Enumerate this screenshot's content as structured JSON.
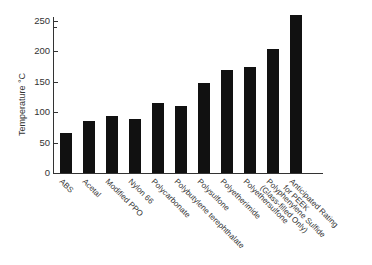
{
  "chart_data": {
    "type": "bar",
    "title": "",
    "xlabel": "",
    "ylabel": "Temperature °C",
    "ylim": [
      0,
      260
    ],
    "yticks": [
      0,
      50,
      100,
      150,
      200,
      250
    ],
    "grid": false,
    "legend": null,
    "categories": [
      "ABS",
      "Acetal",
      "Modified PPO",
      "Nylon 66",
      "Polycarbonate",
      "Polybutylene terephthalate",
      "Polysulfone",
      "Polyetherimide",
      "Polyethersulfone",
      "Polyphenylene Sulfide\n(Glass-filled Only)",
      "Anticipated Rating\nfor PEEK"
    ],
    "values": [
      65,
      85,
      93,
      89,
      115,
      110,
      148,
      170,
      174,
      204,
      260
    ],
    "bar_color": "#111111"
  }
}
